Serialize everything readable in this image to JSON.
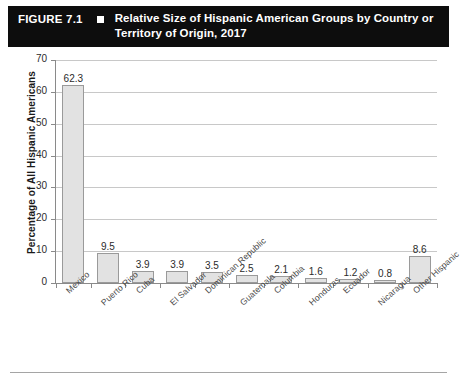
{
  "figure": {
    "number": "FIGURE 7.1",
    "bullet": "square-bullet",
    "title": "Relative Size of Hispanic American Groups by Country or Territory of Origin, 2017"
  },
  "chart_data": {
    "type": "bar",
    "title": "Relative Size of Hispanic American Groups by Country or Territory of Origin, 2017",
    "xlabel": "",
    "ylabel": "Percentage of All Hispanic Americans",
    "ylim": [
      0,
      70
    ],
    "ytick_step": 10,
    "yticks": [
      0,
      10,
      20,
      30,
      40,
      50,
      60,
      70
    ],
    "grid": "horizontal",
    "legend": "none",
    "bar_fill": "#e2e2e2",
    "bar_border": "#9a9a9a",
    "categories": [
      "Mexico",
      "Puerto Rico",
      "Cuba",
      "El Salvador",
      "Dominican Republic",
      "Guatemala",
      "Columbia",
      "Honduras",
      "Ecuador",
      "Nicaragua",
      "Other Hispanic"
    ],
    "values": [
      62.3,
      9.5,
      3.9,
      3.9,
      3.5,
      2.5,
      2.1,
      1.6,
      1.2,
      0.8,
      8.6
    ],
    "value_labels": [
      "62.3",
      "9.5",
      "3.9",
      "3.9",
      "3.5",
      "2.5",
      "2.1",
      "1.6",
      "1.2",
      "0.8",
      "8.6"
    ]
  }
}
